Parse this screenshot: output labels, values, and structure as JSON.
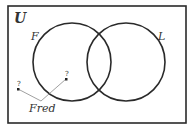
{
  "diagram": {
    "type": "venn",
    "universe_label": "U",
    "sets": [
      {
        "label": "F",
        "cx": 72,
        "cy": 62,
        "r": 39
      },
      {
        "label": "L",
        "cx": 126,
        "cy": 62,
        "r": 39
      }
    ],
    "annotation": {
      "label": "Fred",
      "points": [
        {
          "marker": "?",
          "x": 18,
          "y": 89
        },
        {
          "marker": "?",
          "x": 66,
          "y": 79
        }
      ]
    },
    "colors": {
      "stroke": "#2a2a2a",
      "background": "#ffffff"
    }
  }
}
